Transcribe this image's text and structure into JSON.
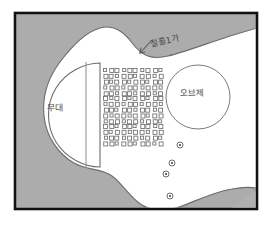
{
  "diagram": {
    "frame": {
      "border_color": "#111111",
      "paper_color": "#ffffff",
      "ground_fill": "#b0b0b0",
      "area_fill": "#ffffff",
      "ink_color": "#555555"
    },
    "labels": {
      "stage": "무대",
      "object": "오브제",
      "divider": "절흘1가"
    },
    "annotations": {
      "arrow": "arrow pointing down-left toward the boundary line"
    },
    "seating_grid": {
      "columns": 10,
      "rows": 14,
      "cell_size": 4,
      "gap": 1.6,
      "origin_x": 104,
      "origin_y": 69,
      "shape": "small open squares"
    },
    "circles": {
      "large": {
        "cx": 198,
        "cy": 97,
        "r": 32,
        "label": "오브제"
      },
      "small": [
        {
          "cx": 180,
          "cy": 145,
          "r": 3
        },
        {
          "cx": 172,
          "cy": 163,
          "r": 3
        },
        {
          "cx": 166,
          "cy": 174,
          "r": 3
        },
        {
          "cx": 170,
          "cy": 196,
          "r": 3
        }
      ]
    }
  }
}
